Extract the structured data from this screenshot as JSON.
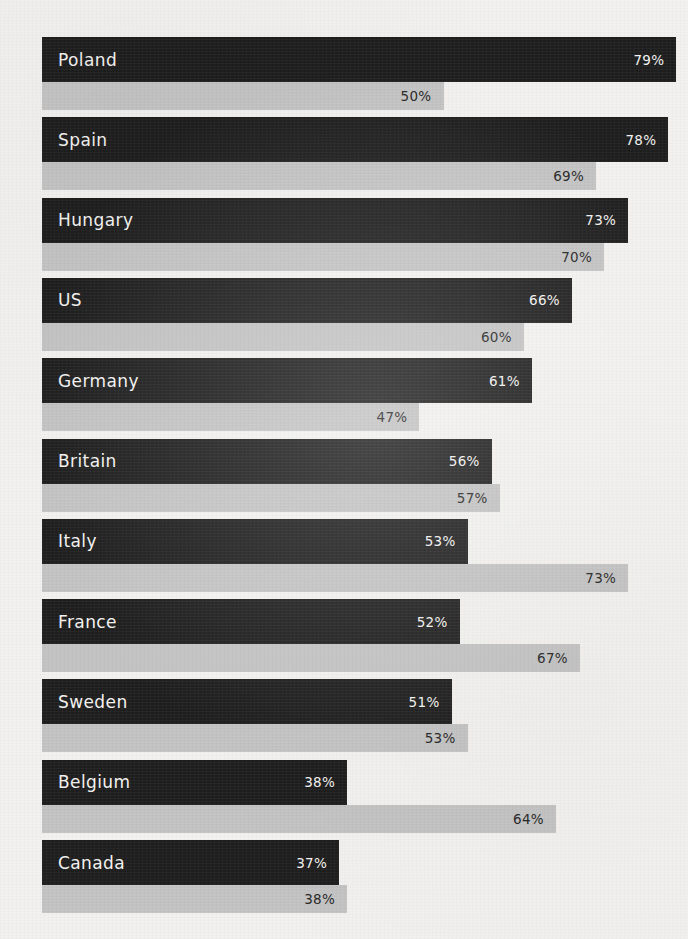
{
  "chart_data": {
    "type": "bar",
    "orientation": "horizontal",
    "title": "",
    "xlabel": "",
    "ylabel": "",
    "xlim": [
      0,
      100
    ],
    "grid": false,
    "legend_position": "none",
    "categories": [
      "Poland",
      "Spain",
      "Hungary",
      "US",
      "Germany",
      "Britain",
      "Italy",
      "France",
      "Sweden",
      "Belgium",
      "Canada"
    ],
    "series": [
      {
        "name": "primary",
        "color": "#1e1e1e",
        "values": [
          79,
          78,
          73,
          66,
          61,
          56,
          53,
          52,
          51,
          38,
          37
        ],
        "labels": [
          "79%",
          "78%",
          "73%",
          "66%",
          "61%",
          "56%",
          "53%",
          "52%",
          "51%",
          "38%",
          "37%"
        ]
      },
      {
        "name": "secondary",
        "color": "#c3c3c3",
        "values": [
          50,
          69,
          70,
          60,
          47,
          57,
          73,
          67,
          53,
          64,
          38
        ],
        "labels": [
          "50%",
          "69%",
          "70%",
          "60%",
          "47%",
          "57%",
          "73%",
          "67%",
          "53%",
          "64%",
          "38%"
        ]
      }
    ],
    "rows": [
      {
        "country": "Poland",
        "primary": 79,
        "primary_label": "79%",
        "secondary": 50,
        "secondary_label": "50%"
      },
      {
        "country": "Spain",
        "primary": 78,
        "primary_label": "78%",
        "secondary": 69,
        "secondary_label": "69%"
      },
      {
        "country": "Hungary",
        "primary": 73,
        "primary_label": "73%",
        "secondary": 70,
        "secondary_label": "70%"
      },
      {
        "country": "US",
        "primary": 66,
        "primary_label": "66%",
        "secondary": 60,
        "secondary_label": "60%"
      },
      {
        "country": "Germany",
        "primary": 61,
        "primary_label": "61%",
        "secondary": 47,
        "secondary_label": "47%"
      },
      {
        "country": "Britain",
        "primary": 56,
        "primary_label": "56%",
        "secondary": 57,
        "secondary_label": "57%"
      },
      {
        "country": "Italy",
        "primary": 53,
        "primary_label": "53%",
        "secondary": 73,
        "secondary_label": "73%"
      },
      {
        "country": "France",
        "primary": 52,
        "primary_label": "52%",
        "secondary": 67,
        "secondary_label": "67%"
      },
      {
        "country": "Sweden",
        "primary": 51,
        "primary_label": "51%",
        "secondary": 53,
        "secondary_label": "53%"
      },
      {
        "country": "Belgium",
        "primary": 38,
        "primary_label": "38%",
        "secondary": 64,
        "secondary_label": "64%"
      },
      {
        "country": "Canada",
        "primary": 37,
        "primary_label": "37%",
        "secondary": 38,
        "secondary_label": "38%"
      }
    ]
  },
  "colors": {
    "background": "#f2f1ef",
    "primary_bar": "#1e1e1e",
    "secondary_bar": "#c3c3c3",
    "primary_text": "#f4f3f1",
    "secondary_text": "#2a2a2a"
  },
  "layout": {
    "bar_left_px": 42,
    "px_per_percent": 8.03,
    "group_top_px": 37,
    "group_pitch_px": 80.3,
    "primary_height_px": 45,
    "secondary_height_px": 28
  }
}
